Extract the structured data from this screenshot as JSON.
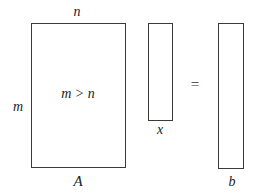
{
  "diagram": {
    "matrix": {
      "name": "A",
      "rows_label": "m",
      "cols_label": "n",
      "condition": "m > n"
    },
    "unknown_vector": {
      "name": "x"
    },
    "operator": "=",
    "rhs_vector": {
      "name": "b"
    },
    "colors": {
      "stroke": "#3a3a3a",
      "text": "#222222",
      "background": "#ffffff"
    }
  }
}
